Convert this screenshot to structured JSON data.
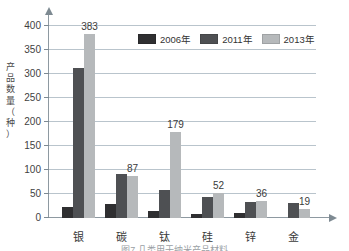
{
  "chart_data": {
    "type": "bar",
    "title": "",
    "xlabel": "",
    "ylabel": "产品数量（种）",
    "ylabel_chars": "产\n品\n数\n量\n（\n种\n）",
    "categories": [
      "银",
      "碳",
      "钛",
      "硅",
      "锌",
      "金"
    ],
    "series": [
      {
        "name": "2006年",
        "color": "#2f2f31",
        "values": [
          23,
          30,
          14,
          9,
          10,
          0
        ]
      },
      {
        "name": "2011年",
        "color": "#4e5053",
        "values": [
          313,
          92,
          59,
          44,
          33,
          31
        ]
      },
      {
        "name": "2013年",
        "color": "#b6b9bb",
        "values": [
          383,
          87,
          179,
          52,
          36,
          19
        ]
      }
    ],
    "data_labels": [
      "383",
      "87",
      "179",
      "52",
      "36",
      "19"
    ],
    "ylim": [
      0,
      425
    ],
    "yticks": [
      0,
      50,
      100,
      150,
      200,
      250,
      300,
      350,
      400
    ],
    "ytick_labels": [
      "0",
      "50",
      "100",
      "150",
      "200",
      "250",
      "300",
      "350",
      "400"
    ],
    "grid": true,
    "legend_position": "top-right"
  },
  "legend": {
    "items": [
      {
        "label": "2006年",
        "color": "#2f2f31"
      },
      {
        "label": "2011年",
        "color": "#4e5053"
      },
      {
        "label": "2013年",
        "color": "#b6b9bb"
      }
    ]
  },
  "caption": {
    "text": "图7  几类用于纳米产品材料"
  },
  "colors": {
    "axis": "#8e99a1",
    "grid": "#b9c4cc",
    "text": "#3a3a3a",
    "series_2006": "#2f2f31",
    "series_2011": "#4e5053",
    "series_2013": "#b6b9bb"
  }
}
